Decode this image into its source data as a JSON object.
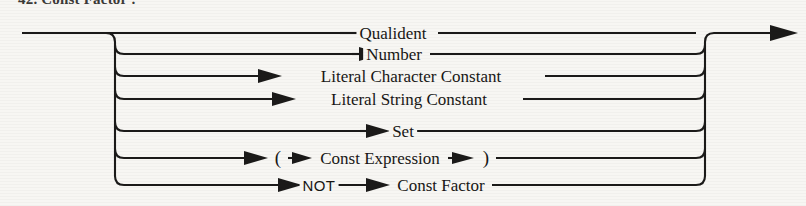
{
  "caption": "42.  Const Factor :",
  "diagram": {
    "title": "Const Factor",
    "type": "railroad-syntax-diagram",
    "entry_label": "entry",
    "exit_label": "exit",
    "line_color": "#1b1a19",
    "background_color": "#f7f6f3",
    "branch_count": 7,
    "branches": [
      {
        "index": 1,
        "y": 33,
        "items": [
          {
            "text": "Qualident",
            "kind": "nonterminal",
            "x": 393
          }
        ]
      },
      {
        "index": 2,
        "y": 54,
        "items": [
          {
            "text": "Number",
            "kind": "nonterminal",
            "x": 394
          }
        ]
      },
      {
        "index": 3,
        "y": 76,
        "items": [
          {
            "text": "Literal Character Constant",
            "kind": "nonterminal",
            "x": 411
          }
        ]
      },
      {
        "index": 4,
        "y": 99,
        "items": [
          {
            "text": "Literal String Constant",
            "kind": "nonterminal",
            "x": 409
          }
        ]
      },
      {
        "index": 5,
        "y": 131,
        "items": [
          {
            "text": "Set",
            "kind": "nonterminal",
            "x": 403
          }
        ]
      },
      {
        "index": 6,
        "y": 158,
        "items": [
          {
            "text": "(",
            "kind": "terminal-paren",
            "x": 278
          },
          {
            "text": "Const Expression",
            "kind": "nonterminal",
            "x": 380
          },
          {
            "text": ")",
            "kind": "terminal-paren",
            "x": 486
          }
        ]
      },
      {
        "index": 7,
        "y": 185,
        "items": [
          {
            "text": "NOT",
            "kind": "terminal",
            "x": 311
          },
          {
            "text": "Const Factor",
            "kind": "nonterminal",
            "x": 428
          }
        ]
      }
    ]
  }
}
